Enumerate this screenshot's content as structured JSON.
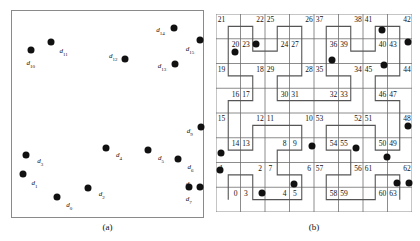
{
  "figure": {
    "panel_a": {
      "caption": "(a)",
      "points": [
        {
          "id": "d0",
          "label": "d",
          "sub": "0",
          "x": 0.235,
          "y": 0.905,
          "lx": 0.3,
          "ly": 0.945
        },
        {
          "id": "d1",
          "label": "d",
          "sub": "1",
          "x": 0.057,
          "y": 0.79,
          "lx": 0.118,
          "ly": 0.84
        },
        {
          "id": "d2",
          "label": "d",
          "sub": "2",
          "x": 0.4,
          "y": 0.86,
          "lx": 0.47,
          "ly": 0.895
        },
        {
          "id": "d3",
          "label": "d",
          "sub": "3",
          "x": 0.075,
          "y": 0.7,
          "lx": 0.148,
          "ly": 0.735
        },
        {
          "id": "d4",
          "label": "d",
          "sub": "4",
          "x": 0.492,
          "y": 0.665,
          "lx": 0.56,
          "ly": 0.706
        },
        {
          "id": "d5",
          "label": "d",
          "sub": "5",
          "x": 0.713,
          "y": 0.675,
          "lx": 0.78,
          "ly": 0.718
        },
        {
          "id": "d6",
          "label": "d",
          "sub": "6",
          "x": 0.87,
          "y": 0.72,
          "lx": 0.935,
          "ly": 0.76
        },
        {
          "id": "d7",
          "label": "d",
          "sub": "7",
          "x": 0.925,
          "y": 0.855,
          "lx": 0.925,
          "ly": 0.918
        },
        {
          "id": "d8",
          "label": "d",
          "sub": "8",
          "x": 0.985,
          "y": 0.852,
          "lx": 0.925,
          "ly": 0.845
        },
        {
          "id": "d9",
          "label": "d",
          "sub": "9",
          "x": 0.988,
          "y": 0.565,
          "lx": 0.93,
          "ly": 0.585
        },
        {
          "id": "d10",
          "label": "d",
          "sub": "10",
          "x": 0.098,
          "y": 0.19,
          "lx": 0.098,
          "ly": 0.255
        },
        {
          "id": "d11",
          "label": "d",
          "sub": "11",
          "x": 0.206,
          "y": 0.15,
          "lx": 0.27,
          "ly": 0.198
        },
        {
          "id": "d12",
          "label": "d",
          "sub": "12",
          "x": 0.592,
          "y": 0.232,
          "lx": 0.53,
          "ly": 0.225
        },
        {
          "id": "d13",
          "label": "d",
          "sub": "13",
          "x": 0.855,
          "y": 0.258,
          "lx": 0.785,
          "ly": 0.272
        },
        {
          "id": "d14",
          "label": "d",
          "sub": "14",
          "x": 0.848,
          "y": 0.082,
          "lx": 0.778,
          "ly": 0.098
        },
        {
          "id": "d15",
          "label": "d",
          "sub": "15",
          "x": 0.982,
          "y": 0.142,
          "lx": 0.932,
          "ly": 0.188
        }
      ]
    },
    "panel_b": {
      "caption": "(b)",
      "grid_size": 8,
      "cell_numbers": [
        [
          21,
          22,
          25,
          26,
          37,
          38,
          41,
          42
        ],
        [
          20,
          23,
          24,
          27,
          36,
          39,
          40,
          43
        ],
        [
          19,
          18,
          29,
          28,
          35,
          34,
          45,
          44
        ],
        [
          16,
          17,
          30,
          31,
          32,
          33,
          46,
          47
        ],
        [
          15,
          12,
          11,
          10,
          53,
          52,
          51,
          48
        ],
        [
          14,
          13,
          8,
          9,
          54,
          55,
          50,
          49
        ],
        [
          1,
          2,
          7,
          6,
          57,
          56,
          61,
          62
        ],
        [
          0,
          3,
          4,
          5,
          58,
          59,
          60,
          63
        ]
      ],
      "points": [
        {
          "id": "p_d0",
          "x": 0.235,
          "y": 0.905
        },
        {
          "id": "p_d1",
          "x": 0.02,
          "y": 0.79
        },
        {
          "id": "p_d2",
          "x": 0.4,
          "y": 0.86
        },
        {
          "id": "p_d3",
          "x": 0.028,
          "y": 0.7
        },
        {
          "id": "p_d4",
          "x": 0.492,
          "y": 0.665
        },
        {
          "id": "p_d5",
          "x": 0.713,
          "y": 0.675
        },
        {
          "id": "p_d6",
          "x": 0.87,
          "y": 0.72
        },
        {
          "id": "p_d7",
          "x": 0.925,
          "y": 0.855
        },
        {
          "id": "p_d8",
          "x": 0.985,
          "y": 0.852
        },
        {
          "id": "p_d9",
          "x": 0.982,
          "y": 0.565
        },
        {
          "id": "p_d10",
          "x": 0.098,
          "y": 0.19
        },
        {
          "id": "p_d11",
          "x": 0.206,
          "y": 0.15
        },
        {
          "id": "p_d12",
          "x": 0.592,
          "y": 0.232
        },
        {
          "id": "p_d13",
          "x": 0.855,
          "y": 0.258
        },
        {
          "id": "p_d14",
          "x": 0.848,
          "y": 0.082
        },
        {
          "id": "p_d15",
          "x": 0.982,
          "y": 0.142
        }
      ]
    }
  },
  "chart_data": {
    "type": "scatter",
    "title": "",
    "xlabel": "",
    "ylabel": "",
    "xlim": [
      0,
      1
    ],
    "ylim": [
      0,
      1
    ],
    "grid": false,
    "legend": null,
    "panels": [
      {
        "name": "(a)",
        "description": "Scatter of 16 labeled data objects d0..d15 inside a bounding square",
        "labels": [
          "d0",
          "d1",
          "d2",
          "d3",
          "d4",
          "d5",
          "d6",
          "d7",
          "d8",
          "d9",
          "d10",
          "d11",
          "d12",
          "d13",
          "d14",
          "d15"
        ],
        "x": [
          0.235,
          0.057,
          0.4,
          0.075,
          0.492,
          0.713,
          0.87,
          0.925,
          0.985,
          0.988,
          0.098,
          0.206,
          0.592,
          0.855,
          0.848,
          0.982
        ],
        "y": [
          0.095,
          0.21,
          0.14,
          0.3,
          0.335,
          0.325,
          0.28,
          0.145,
          0.148,
          0.435,
          0.81,
          0.85,
          0.768,
          0.742,
          0.918,
          0.858
        ]
      },
      {
        "name": "(b)",
        "description": "Same 16 points overlaid on an 8x8 grid whose cells are indexed 0..63 along a Hilbert space-filling curve",
        "grid_rows": 8,
        "grid_cols": 8,
        "cell_index_matrix_top_to_bottom": [
          [
            21,
            22,
            25,
            26,
            37,
            38,
            41,
            42
          ],
          [
            20,
            23,
            24,
            27,
            36,
            39,
            40,
            43
          ],
          [
            19,
            18,
            29,
            28,
            35,
            34,
            45,
            44
          ],
          [
            16,
            17,
            30,
            31,
            32,
            33,
            46,
            47
          ],
          [
            15,
            12,
            11,
            10,
            53,
            52,
            51,
            48
          ],
          [
            14,
            13,
            8,
            9,
            54,
            55,
            50,
            49
          ],
          [
            1,
            2,
            7,
            6,
            57,
            56,
            61,
            62
          ],
          [
            0,
            3,
            4,
            5,
            58,
            59,
            60,
            63
          ]
        ]
      }
    ]
  }
}
